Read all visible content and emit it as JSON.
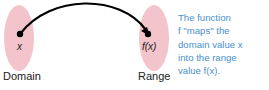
{
  "diagram": {
    "domain": {
      "label": "Domain",
      "element": "x"
    },
    "range": {
      "label": "Range",
      "element": "f(x)"
    },
    "caption": {
      "lines": [
        "The function",
        "f \"maps\" the",
        "domain value x",
        "into the range",
        "value f(x)."
      ]
    },
    "colors": {
      "set_fill": "#f4c4cc",
      "arrow": "#000000",
      "caption": "#4a90d0"
    }
  }
}
